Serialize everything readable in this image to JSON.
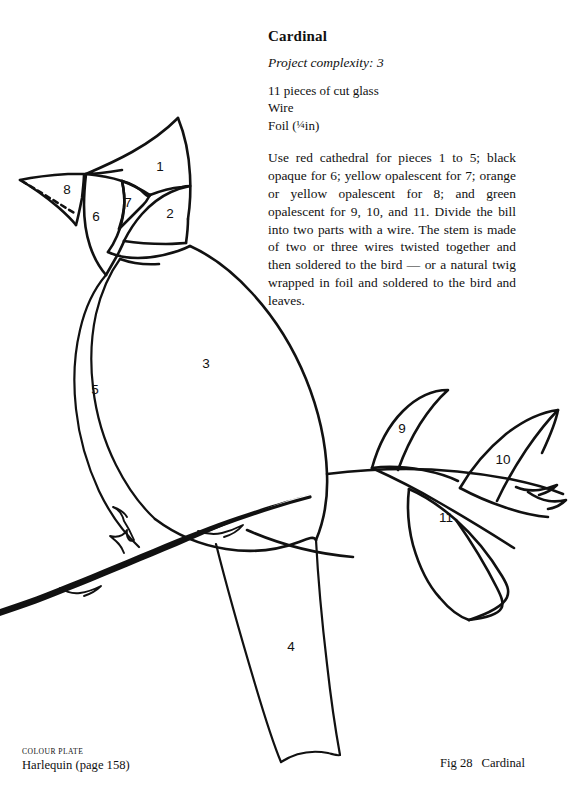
{
  "page": {
    "kind": "craft-pattern-plate",
    "background_color": "#ffffff",
    "ink_color": "#111111"
  },
  "text_column": {
    "title": "Cardinal",
    "complexity": "Project complexity: 3",
    "materials": [
      "11 pieces of cut glass",
      "Wire",
      "Foil (¼in)"
    ],
    "materials_lines": {
      "glass": "11 pieces of cut glass",
      "wire": "Wire",
      "foil_prefix": "Foil (",
      "foil_fraction": "¼",
      "foil_suffix": "in)"
    },
    "instructions": "Use red cathedral for pieces 1 to 5; black opaque for 6; yellow opalescent for 7; orange or yellow opalescent for 8; and green opalescent for 9, 10, and 11. Divide the bill into two parts with a wire. The stem is made of two or three wires twisted together and then soldered to the bird — or a natural twig wrapped in foil and soldered to the bird and leaves."
  },
  "diagram": {
    "piece_count": 11,
    "pieces": [
      {
        "id": "1",
        "name": "crest",
        "label": "1",
        "x": 160,
        "y": 167
      },
      {
        "id": "2",
        "name": "cheek",
        "label": "2",
        "x": 170,
        "y": 214
      },
      {
        "id": "3",
        "name": "body",
        "label": "3",
        "x": 206,
        "y": 364
      },
      {
        "id": "4",
        "name": "tail",
        "label": "4",
        "x": 291,
        "y": 647
      },
      {
        "id": "5",
        "name": "breast",
        "label": "5",
        "x": 95,
        "y": 390
      },
      {
        "id": "6",
        "name": "face-mask",
        "label": "6",
        "x": 96,
        "y": 217
      },
      {
        "id": "7",
        "name": "eye-patch",
        "label": "7",
        "x": 128,
        "y": 203
      },
      {
        "id": "8",
        "name": "beak",
        "label": "8",
        "x": 67,
        "y": 190
      },
      {
        "id": "9",
        "name": "leaf-upper",
        "label": "9",
        "x": 402,
        "y": 429
      },
      {
        "id": "10",
        "name": "leaf-right",
        "label": "10",
        "x": 503,
        "y": 460
      },
      {
        "id": "11",
        "name": "leaf-lower",
        "label": "11",
        "x": 446,
        "y": 518
      }
    ],
    "divider_note": "dashed line across beak marks the wire division"
  },
  "footer": {
    "colour_plate_label": "COLOUR PLATE",
    "colour_plate_caption": "Harlequin (page 158)",
    "figure_number": "Fig 28",
    "figure_title": "Cardinal"
  }
}
